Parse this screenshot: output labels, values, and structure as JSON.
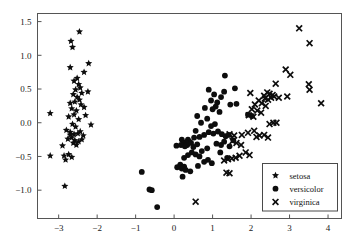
{
  "chart_data": {
    "type": "scatter",
    "title": "",
    "xlabel": "",
    "ylabel": "",
    "xlim": [
      -3.55,
      4.35
    ],
    "ylim": [
      -1.42,
      1.62
    ],
    "grid": false,
    "legend_position": "lower-right",
    "xticks": [
      -3,
      -2,
      -1,
      0,
      1,
      2,
      3,
      4
    ],
    "xticklabels": [
      "−3",
      "−2",
      "−1",
      "0",
      "1",
      "2",
      "3",
      "4"
    ],
    "yticks": [
      -1.0,
      -0.5,
      0.0,
      0.5,
      1.0,
      1.5
    ],
    "yticklabels": [
      "−1.0",
      "−0.5",
      "0.0",
      "0.5",
      "1.0",
      "1.5"
    ],
    "series": [
      {
        "name": "setosa",
        "marker": "star",
        "color": "#0d0d0d",
        "points": [
          [
            -2.46,
            1.35
          ],
          [
            -2.68,
            1.21
          ],
          [
            -2.64,
            1.12
          ],
          [
            -2.7,
            0.82
          ],
          [
            -2.22,
            0.88
          ],
          [
            -2.34,
            0.75
          ],
          [
            -2.52,
            0.66
          ],
          [
            -2.6,
            0.62
          ],
          [
            -2.48,
            0.57
          ],
          [
            -2.44,
            0.52
          ],
          [
            -2.56,
            0.49
          ],
          [
            -2.24,
            0.46
          ],
          [
            -2.4,
            0.44
          ],
          [
            -2.62,
            0.42
          ],
          [
            -2.52,
            0.38
          ],
          [
            -2.46,
            0.34
          ],
          [
            -2.58,
            0.31
          ],
          [
            -2.7,
            0.29
          ],
          [
            -2.42,
            0.27
          ],
          [
            -2.34,
            0.23
          ],
          [
            -2.66,
            0.21
          ],
          [
            -2.54,
            0.18
          ],
          [
            -3.22,
            0.14
          ],
          [
            -2.74,
            0.09
          ],
          [
            -2.6,
            0.12
          ],
          [
            -2.3,
            0.11
          ],
          [
            -2.48,
            0.05
          ],
          [
            -2.16,
            -0.03
          ],
          [
            -2.64,
            -0.02
          ],
          [
            -2.56,
            -0.06
          ],
          [
            -2.8,
            -0.11
          ],
          [
            -2.7,
            -0.14
          ],
          [
            -2.6,
            -0.17
          ],
          [
            -2.5,
            -0.16
          ],
          [
            -2.44,
            -0.13
          ],
          [
            -2.36,
            -0.19
          ],
          [
            -2.66,
            -0.22
          ],
          [
            -2.76,
            -0.24
          ],
          [
            -2.58,
            -0.26
          ],
          [
            -2.48,
            -0.28
          ],
          [
            -2.4,
            -0.25
          ],
          [
            -2.62,
            -0.3
          ],
          [
            -2.54,
            -0.33
          ],
          [
            -2.9,
            -0.34
          ],
          [
            -2.7,
            -0.18
          ],
          [
            -2.86,
            -0.49
          ],
          [
            -2.74,
            -0.47
          ],
          [
            -3.22,
            -0.49
          ],
          [
            -2.82,
            -0.55
          ],
          [
            -2.66,
            -0.51
          ],
          [
            -2.84,
            -0.94
          ]
        ]
      },
      {
        "name": "versicolor",
        "marker": "circle",
        "color": "#0d0d0d",
        "points": [
          [
            1.32,
            0.7
          ],
          [
            0.9,
            0.49
          ],
          [
            1.3,
            0.46
          ],
          [
            1.58,
            0.51
          ],
          [
            1.04,
            0.42
          ],
          [
            1.22,
            0.38
          ],
          [
            0.96,
            0.33
          ],
          [
            1.12,
            0.3
          ],
          [
            1.46,
            0.27
          ],
          [
            1.62,
            0.28
          ],
          [
            1.08,
            0.24
          ],
          [
            0.8,
            0.22
          ],
          [
            1.0,
            0.2
          ],
          [
            1.18,
            0.16
          ],
          [
            1.92,
            0.12
          ],
          [
            2.02,
            0.1
          ],
          [
            0.6,
            0.1
          ],
          [
            0.86,
            0.06
          ],
          [
            0.7,
            0.0
          ],
          [
            1.06,
            -0.02
          ],
          [
            0.96,
            -0.05
          ],
          [
            0.56,
            -0.12
          ],
          [
            0.9,
            -0.14
          ],
          [
            1.02,
            -0.16
          ],
          [
            1.14,
            -0.13
          ],
          [
            1.24,
            -0.17
          ],
          [
            0.78,
            -0.18
          ],
          [
            0.66,
            -0.21
          ],
          [
            1.34,
            -0.2
          ],
          [
            1.42,
            -0.18
          ],
          [
            0.36,
            -0.25
          ],
          [
            0.2,
            -0.25
          ],
          [
            0.06,
            -0.34
          ],
          [
            0.4,
            -0.28
          ],
          [
            0.3,
            -0.29
          ],
          [
            0.24,
            -0.31
          ],
          [
            0.34,
            -0.33
          ],
          [
            0.44,
            -0.3
          ],
          [
            0.18,
            -0.33
          ],
          [
            0.28,
            -0.35
          ],
          [
            0.5,
            -0.36
          ],
          [
            0.6,
            -0.32
          ],
          [
            1.1,
            -0.31
          ],
          [
            1.22,
            -0.33
          ],
          [
            1.3,
            -0.28
          ],
          [
            0.86,
            -0.38
          ],
          [
            0.72,
            -0.42
          ],
          [
            0.46,
            -0.44
          ],
          [
            0.56,
            -0.47
          ],
          [
            0.66,
            -0.5
          ],
          [
            0.36,
            -0.48
          ],
          [
            0.26,
            -0.52
          ],
          [
            1.38,
            -0.52
          ],
          [
            0.88,
            -0.55
          ],
          [
            0.78,
            -0.58
          ],
          [
            0.98,
            -0.6
          ],
          [
            0.16,
            -0.62
          ],
          [
            0.26,
            -0.65
          ],
          [
            0.62,
            -0.64
          ],
          [
            0.08,
            -0.66
          ],
          [
            0.2,
            -0.68
          ],
          [
            0.3,
            -0.7
          ],
          [
            0.42,
            -0.72
          ],
          [
            0.22,
            -0.8
          ],
          [
            -0.84,
            -0.73
          ],
          [
            -0.64,
            -0.99
          ],
          [
            -0.58,
            -1.0
          ],
          [
            -0.44,
            -1.25
          ],
          [
            1.54,
            -0.26
          ],
          [
            1.44,
            -0.35
          ],
          [
            1.2,
            -0.44
          ],
          [
            0.52,
            -0.22
          ]
        ]
      },
      {
        "name": "virginica",
        "marker": "x",
        "color": "#0d0d0d",
        "points": [
          [
            3.25,
            1.4
          ],
          [
            3.52,
            1.18
          ],
          [
            2.9,
            0.79
          ],
          [
            3.02,
            0.71
          ],
          [
            3.5,
            0.57
          ],
          [
            3.52,
            0.49
          ],
          [
            2.64,
            0.58
          ],
          [
            2.42,
            0.45
          ],
          [
            1.98,
            0.44
          ],
          [
            2.34,
            0.4
          ],
          [
            2.48,
            0.43
          ],
          [
            2.56,
            0.41
          ],
          [
            2.6,
            0.39
          ],
          [
            2.36,
            0.36
          ],
          [
            2.44,
            0.34
          ],
          [
            2.52,
            0.37
          ],
          [
            2.94,
            0.39
          ],
          [
            2.72,
            0.37
          ],
          [
            2.2,
            0.33
          ],
          [
            2.28,
            0.29
          ],
          [
            2.1,
            0.27
          ],
          [
            2.38,
            0.25
          ],
          [
            2.02,
            0.2
          ],
          [
            2.16,
            0.18
          ],
          [
            2.26,
            0.15
          ],
          [
            1.94,
            0.11
          ],
          [
            2.06,
            0.09
          ],
          [
            3.82,
            0.29
          ],
          [
            2.48,
            -0.02
          ],
          [
            2.58,
            0.0
          ],
          [
            2.66,
            0.0
          ],
          [
            2.08,
            -0.12
          ],
          [
            1.92,
            -0.15
          ],
          [
            1.76,
            -0.18
          ],
          [
            1.44,
            -0.17
          ],
          [
            1.56,
            -0.19
          ],
          [
            2.22,
            -0.19
          ],
          [
            2.34,
            -0.18
          ],
          [
            2.44,
            -0.22
          ],
          [
            2.14,
            -0.21
          ],
          [
            1.52,
            -0.27
          ],
          [
            1.62,
            -0.3
          ],
          [
            1.74,
            -0.33
          ],
          [
            1.86,
            -0.44
          ],
          [
            1.96,
            -0.48
          ],
          [
            1.7,
            -0.49
          ],
          [
            1.6,
            -0.52
          ],
          [
            1.5,
            -0.53
          ],
          [
            1.4,
            -0.54
          ],
          [
            1.3,
            -0.56
          ],
          [
            1.36,
            -0.74
          ],
          [
            1.44,
            -0.75
          ],
          [
            0.56,
            -1.17
          ]
        ]
      }
    ]
  },
  "legend": {
    "entries": [
      {
        "label": "setosa",
        "marker": "star-icon"
      },
      {
        "label": "versicolor",
        "marker": "circle-icon"
      },
      {
        "label": "virginica",
        "marker": "cross-icon"
      }
    ]
  }
}
